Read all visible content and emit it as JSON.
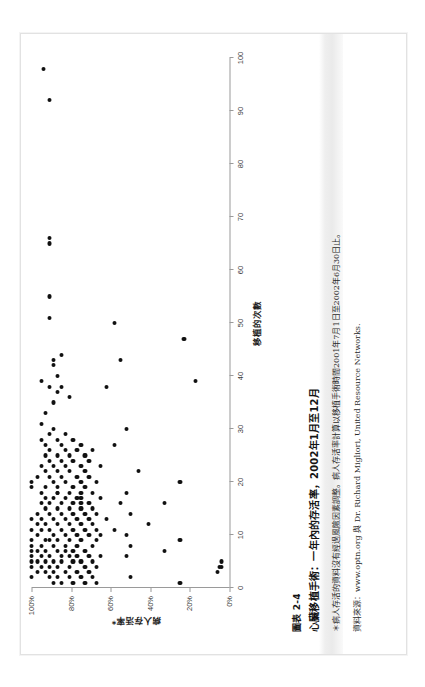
{
  "page": {
    "orientation": "rotated-90-ccw",
    "background_color": "#ffffff",
    "sheet_border_color": "#e2e2e2"
  },
  "caption": {
    "figure_number": "圖表 2-4",
    "title": "心臟移植手術：一年內的存活率，2002年1月至12月",
    "note": "＊病人存活的資料沒有經過風險因素調整。病人存活率計算以移植手術時間2001年7月1日至2002年6月30日止。",
    "source": "資料來源：www.optn.org 與 Dr. Richard Migliori, United Resource Networks."
  },
  "chart_data": {
    "type": "scatter",
    "title": "心臟移植手術：一年內的存活率，2002年1月至12月",
    "xlabel": "移植的次數",
    "ylabel": "病人存活率*",
    "xlim": [
      0,
      100
    ],
    "ylim": [
      0,
      100
    ],
    "xticks": [
      0,
      10,
      20,
      30,
      40,
      50,
      60,
      70,
      80,
      90,
      100
    ],
    "xticklabels": [
      "0",
      "10",
      "20",
      "30",
      "40",
      "50",
      "60",
      "70",
      "80",
      "90",
      "100"
    ],
    "yticks": [
      0,
      20,
      40,
      60,
      80,
      100
    ],
    "yticklabels": [
      "0%",
      "20%",
      "40%",
      "60%",
      "80%",
      "100%"
    ],
    "grid": false,
    "legend": null,
    "marker_color": "#111111",
    "points": [
      [
        2,
        100
      ],
      [
        4,
        100
      ],
      [
        5,
        100
      ],
      [
        6,
        100
      ],
      [
        7,
        100
      ],
      [
        8,
        100
      ],
      [
        9,
        100
      ],
      [
        11,
        100
      ],
      [
        13,
        100
      ],
      [
        19,
        100
      ],
      [
        20,
        100
      ],
      [
        3,
        97
      ],
      [
        5,
        97
      ],
      [
        7,
        97
      ],
      [
        10,
        97
      ],
      [
        12,
        97
      ],
      [
        14,
        97
      ],
      [
        21,
        97
      ],
      [
        4,
        95
      ],
      [
        6,
        95
      ],
      [
        8,
        95
      ],
      [
        11,
        95
      ],
      [
        13,
        95
      ],
      [
        16,
        95
      ],
      [
        18,
        95
      ],
      [
        23,
        95
      ],
      [
        28,
        95
      ],
      [
        31,
        95
      ],
      [
        39,
        95
      ],
      [
        3,
        93
      ],
      [
        5,
        93
      ],
      [
        7,
        93
      ],
      [
        9,
        93
      ],
      [
        12,
        93
      ],
      [
        15,
        93
      ],
      [
        17,
        93
      ],
      [
        19,
        93
      ],
      [
        22,
        93
      ],
      [
        25,
        93
      ],
      [
        27,
        93
      ],
      [
        33,
        93
      ],
      [
        2,
        91
      ],
      [
        4,
        91
      ],
      [
        6,
        91
      ],
      [
        9,
        91
      ],
      [
        11,
        91
      ],
      [
        14,
        91
      ],
      [
        16,
        91
      ],
      [
        21,
        91
      ],
      [
        24,
        91
      ],
      [
        26,
        91
      ],
      [
        29,
        91
      ],
      [
        38,
        91
      ],
      [
        51,
        91
      ],
      [
        55,
        91
      ],
      [
        65,
        91
      ],
      [
        66,
        91
      ],
      [
        92,
        91
      ],
      [
        98,
        94
      ],
      [
        1,
        89
      ],
      [
        3,
        89
      ],
      [
        5,
        89
      ],
      [
        8,
        89
      ],
      [
        10,
        89
      ],
      [
        13,
        89
      ],
      [
        17,
        89
      ],
      [
        20,
        89
      ],
      [
        23,
        89
      ],
      [
        30,
        89
      ],
      [
        35,
        89
      ],
      [
        42,
        89
      ],
      [
        43,
        89
      ],
      [
        2,
        87
      ],
      [
        4,
        87
      ],
      [
        7,
        87
      ],
      [
        9,
        87
      ],
      [
        12,
        87
      ],
      [
        15,
        87
      ],
      [
        18,
        87
      ],
      [
        18,
        87
      ],
      [
        19,
        87
      ],
      [
        22,
        87
      ],
      [
        25,
        87
      ],
      [
        28,
        87
      ],
      [
        37,
        87
      ],
      [
        40,
        87
      ],
      [
        1,
        85
      ],
      [
        5,
        85
      ],
      [
        6,
        85
      ],
      [
        11,
        85
      ],
      [
        14,
        85
      ],
      [
        16,
        85
      ],
      [
        21,
        85
      ],
      [
        24,
        85
      ],
      [
        27,
        85
      ],
      [
        38,
        85
      ],
      [
        44,
        85
      ],
      [
        3,
        83
      ],
      [
        7,
        83
      ],
      [
        8,
        83
      ],
      [
        10,
        83
      ],
      [
        13,
        83
      ],
      [
        17,
        83
      ],
      [
        20,
        83
      ],
      [
        23,
        83
      ],
      [
        26,
        83
      ],
      [
        29,
        83
      ],
      [
        2,
        81
      ],
      [
        4,
        81
      ],
      [
        6,
        81
      ],
      [
        9,
        81
      ],
      [
        12,
        81
      ],
      [
        15,
        81
      ],
      [
        18,
        81
      ],
      [
        22,
        81
      ],
      [
        25,
        81
      ],
      [
        36,
        81
      ],
      [
        1,
        79
      ],
      [
        5,
        79
      ],
      [
        7,
        79
      ],
      [
        11,
        79
      ],
      [
        14,
        79
      ],
      [
        16,
        79
      ],
      [
        19,
        79
      ],
      [
        24,
        79
      ],
      [
        28,
        79
      ],
      [
        3,
        77
      ],
      [
        6,
        77
      ],
      [
        8,
        77
      ],
      [
        10,
        77
      ],
      [
        13,
        77
      ],
      [
        17,
        77
      ],
      [
        21,
        77
      ],
      [
        26,
        77
      ],
      [
        2,
        75
      ],
      [
        5,
        75
      ],
      [
        9,
        75
      ],
      [
        12,
        75
      ],
      [
        15,
        75
      ],
      [
        16,
        75
      ],
      [
        17,
        75
      ],
      [
        18,
        75
      ],
      [
        20,
        75
      ],
      [
        23,
        75
      ],
      [
        27,
        75
      ],
      [
        1,
        73
      ],
      [
        4,
        73
      ],
      [
        7,
        73
      ],
      [
        11,
        73
      ],
      [
        14,
        73
      ],
      [
        19,
        73
      ],
      [
        22,
        73
      ],
      [
        25,
        73
      ],
      [
        3,
        71
      ],
      [
        6,
        71
      ],
      [
        10,
        71
      ],
      [
        13,
        71
      ],
      [
        16,
        71
      ],
      [
        21,
        71
      ],
      [
        24,
        71
      ],
      [
        2,
        69
      ],
      [
        5,
        69
      ],
      [
        8,
        69
      ],
      [
        12,
        69
      ],
      [
        15,
        69
      ],
      [
        18,
        69
      ],
      [
        26,
        69
      ],
      [
        1,
        67
      ],
      [
        4,
        67
      ],
      [
        9,
        67
      ],
      [
        11,
        67
      ],
      [
        14,
        67
      ],
      [
        20,
        67
      ],
      [
        6,
        65
      ],
      [
        10,
        65
      ],
      [
        17,
        65
      ],
      [
        23,
        65
      ],
      [
        13,
        62
      ],
      [
        38,
        62
      ],
      [
        11,
        58
      ],
      [
        27,
        58
      ],
      [
        50,
        58
      ],
      [
        16,
        55
      ],
      [
        43,
        55
      ],
      [
        6,
        52
      ],
      [
        10,
        52
      ],
      [
        18,
        52
      ],
      [
        30,
        52
      ],
      [
        2,
        50
      ],
      [
        8,
        50
      ],
      [
        14,
        50
      ],
      [
        22,
        46
      ],
      [
        12,
        41
      ],
      [
        7,
        33
      ],
      [
        16,
        33
      ],
      [
        1,
        25
      ],
      [
        9,
        25
      ],
      [
        20,
        25
      ],
      [
        47,
        23
      ],
      [
        39,
        17
      ],
      [
        3,
        6
      ],
      [
        4,
        5
      ],
      [
        4,
        4
      ],
      [
        5,
        4
      ]
    ]
  }
}
